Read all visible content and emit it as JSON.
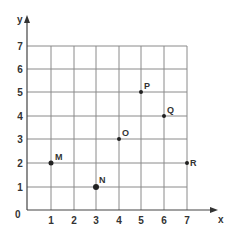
{
  "diagram": {
    "type": "coordinate-grid",
    "axes": {
      "x_label": "x",
      "y_label": "y"
    },
    "x_ticks": [
      "1",
      "2",
      "3",
      "4",
      "5",
      "6",
      "7"
    ],
    "y_ticks": [
      "1",
      "2",
      "3",
      "4",
      "5",
      "6",
      "7"
    ],
    "origin_label": "0",
    "points": [
      {
        "label": "M",
        "x": 1,
        "y": 2
      },
      {
        "label": "N",
        "x": 3,
        "y": 1
      },
      {
        "label": "O",
        "x": 4,
        "y": 3
      },
      {
        "label": "P",
        "x": 5,
        "y": 5
      },
      {
        "label": "Q",
        "x": 6,
        "y": 4
      },
      {
        "label": "R",
        "x": 7,
        "y": 2
      }
    ],
    "colors": {
      "grid": "#8a8a8a",
      "axis": "#444444",
      "point": "#222222"
    }
  }
}
